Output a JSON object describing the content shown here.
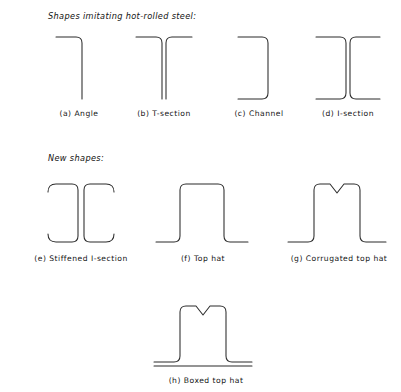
{
  "figure": {
    "groups": [
      {
        "id": "hot-rolled",
        "label": "Shapes imitating hot-rolled steel:"
      },
      {
        "id": "new-shapes",
        "label": "New shapes:"
      }
    ],
    "shapes": [
      {
        "key": "a",
        "caption": "(a) Angle",
        "group": "hot-rolled"
      },
      {
        "key": "b",
        "caption": "(b) T-section",
        "group": "hot-rolled"
      },
      {
        "key": "c",
        "caption": "(c) Channel",
        "group": "hot-rolled"
      },
      {
        "key": "d",
        "caption": "(d) I-section",
        "group": "hot-rolled"
      },
      {
        "key": "e",
        "caption": "(e) Stiffened I-section",
        "group": "new-shapes"
      },
      {
        "key": "f",
        "caption": "(f) Top hat",
        "group": "new-shapes"
      },
      {
        "key": "g",
        "caption": "(g) Corrugated top hat",
        "group": "new-shapes"
      },
      {
        "key": "h",
        "caption": "(h) Boxed top hat",
        "group": "new-shapes"
      }
    ],
    "style": {
      "line_color": "#2b2b2b",
      "background": "#ffffff",
      "text_color": "#141414"
    }
  }
}
